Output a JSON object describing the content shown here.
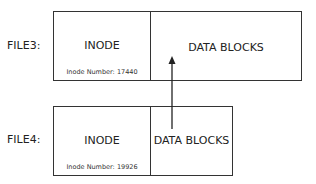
{
  "files": [
    {
      "label": "FILE3:",
      "inode": {
        "title": "INODE",
        "number_text": "Inode Number: 17440"
      },
      "data_blocks": {
        "title": "DATA BLOCKS"
      }
    },
    {
      "label": "FILE4:",
      "inode": {
        "title": "INODE",
        "number_text": "Inode Number: 19926"
      },
      "data_blocks": {
        "title": "DATA BLOCKS"
      }
    }
  ],
  "arrow": {
    "from": "FILE4 DATA BLOCKS",
    "to": "FILE3 DATA BLOCKS"
  },
  "colors": {
    "stroke": "#333333",
    "text": "#222222"
  }
}
